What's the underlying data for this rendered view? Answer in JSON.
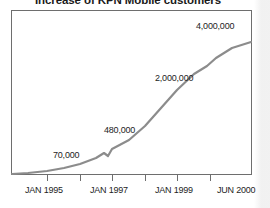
{
  "chart_data": {
    "type": "line",
    "title": "Increase of KPN Mobile customers",
    "xlabel": "",
    "ylabel": "",
    "grid": false,
    "legend": "none",
    "line_color": "#8c8c8c",
    "frame_color": "#6e6e6e",
    "x_tick_labels": [
      "JAN 1995",
      "JAN 1997",
      "JAN 1999",
      "JUN 2000"
    ],
    "x_tick_positions": [
      47,
      112,
      177,
      240
    ],
    "x_minor_tick_positions": [
      47,
      80,
      112,
      145,
      177,
      210,
      240
    ],
    "axis_range_start": "JAN 1994",
    "axis_range_end": "JUN 2000",
    "annotations": [
      {
        "text": "70,000",
        "x": 75,
        "y": 156
      },
      {
        "text": "480,000",
        "x": 134,
        "y": 131
      },
      {
        "text": "2,000,000",
        "x": 188,
        "y": 79
      },
      {
        "text": "4,000,000",
        "x": 229,
        "y": 27
      }
    ],
    "series": [
      {
        "name": "KPN Mobile customers",
        "points": [
          {
            "label": "JAN 1994",
            "x": 12,
            "y": 174,
            "value": 10000
          },
          {
            "label": "JUL 1994",
            "x": 28,
            "y": 173,
            "value": 20000
          },
          {
            "label": "JAN 1995",
            "x": 47,
            "y": 171,
            "value": 70000
          },
          {
            "label": "JUL 1995",
            "x": 64,
            "y": 168,
            "value": 110000
          },
          {
            "label": "JAN 1996",
            "x": 80,
            "y": 164,
            "value": 170000
          },
          {
            "label": "JUL 1996",
            "x": 96,
            "y": 158,
            "value": 280000
          },
          {
            "label": "OCT 1996",
            "x": 104,
            "y": 153,
            "value": 360000
          },
          {
            "label": "NOV 1996",
            "x": 108,
            "y": 156,
            "value": 390000
          },
          {
            "label": "JAN 1997",
            "x": 112,
            "y": 149,
            "value": 480000
          },
          {
            "label": "JUL 1997",
            "x": 129,
            "y": 140,
            "value": 700000
          },
          {
            "label": "JAN 1998",
            "x": 145,
            "y": 126,
            "value": 1000000
          },
          {
            "label": "JUL 1998",
            "x": 161,
            "y": 108,
            "value": 1450000
          },
          {
            "label": "JAN 1999",
            "x": 177,
            "y": 90,
            "value": 2000000
          },
          {
            "label": "JUL 1999",
            "x": 194,
            "y": 74,
            "value": 2600000
          },
          {
            "label": "NOV 1999",
            "x": 207,
            "y": 66,
            "value": 3200000
          },
          {
            "label": "JAN 2000",
            "x": 216,
            "y": 58,
            "value": 3700000
          },
          {
            "label": "APR 2000",
            "x": 232,
            "y": 48,
            "value": 3950000
          },
          {
            "label": "JUN 2000",
            "x": 251,
            "y": 42,
            "value": 4300000
          }
        ]
      }
    ]
  },
  "plot": {
    "frame": {
      "left": 11,
      "top": 10,
      "right": 252,
      "bottom": 175
    }
  }
}
